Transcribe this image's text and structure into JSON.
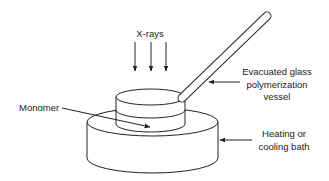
{
  "diagram": {
    "type": "apparatus-schematic",
    "colors": {
      "line": "#222222",
      "background": "#ffffff"
    },
    "labels": {
      "xrays": "X-rays",
      "vessel_line1": "Evacuated glass",
      "vessel_line2": "polymerization",
      "vessel_line3": "vessel",
      "monomer": "Monomer",
      "bath_line1": "Heating or",
      "bath_line2": "cooling bath"
    },
    "components": [
      {
        "id": "xray-arrows",
        "count": 3,
        "direction": "down"
      },
      {
        "id": "polymerization-vessel",
        "shape": "cylinder-with-tube"
      },
      {
        "id": "monomer",
        "shape": "liquid-layer"
      },
      {
        "id": "bath",
        "shape": "cylinder"
      }
    ]
  }
}
